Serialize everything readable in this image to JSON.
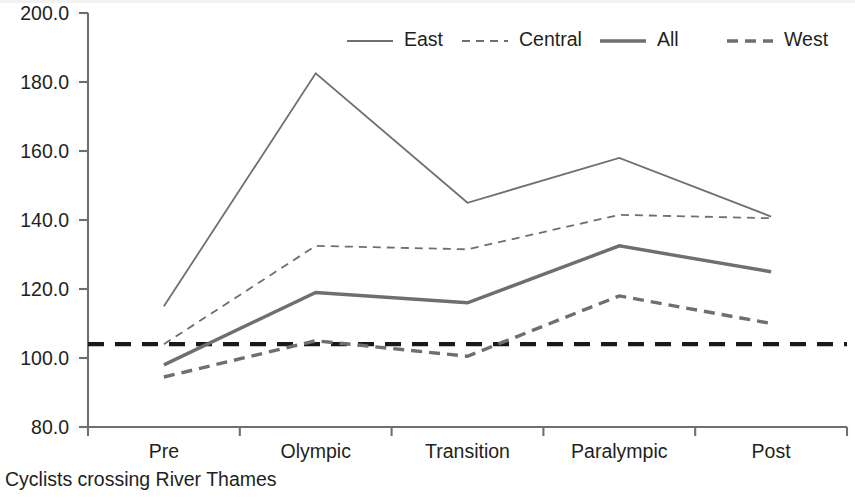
{
  "caption": "Cyclists crossing River Thames",
  "colors": {
    "series_gray": "#6f6f70",
    "reference_black": "#1a1a1a",
    "text": "#231f20",
    "background": "#ffffff"
  },
  "chart_data": {
    "type": "line",
    "title": "",
    "subtitle": "",
    "xlabel": "",
    "ylabel": "",
    "categories": [
      "Pre",
      "Olympic",
      "Transition",
      "Paralympic",
      "Post"
    ],
    "ylim": [
      80.0,
      200.0
    ],
    "ytick_labels": [
      "200.0",
      "180.0",
      "160.0",
      "140.0",
      "120.0",
      "100.0",
      "80.0"
    ],
    "ytick_values": [
      200.0,
      180.0,
      160.0,
      140.0,
      120.0,
      100.0,
      80.0
    ],
    "grid": false,
    "legend_position": "top",
    "series": [
      {
        "name": "East",
        "values": [
          115.0,
          182.5,
          145.0,
          158.0,
          141.0
        ],
        "style": "solid",
        "width": "thin",
        "color": "#6f6f70"
      },
      {
        "name": "Central",
        "values": [
          104.0,
          132.5,
          131.5,
          141.5,
          140.5
        ],
        "style": "dashed",
        "width": "thin",
        "color": "#6f6f70"
      },
      {
        "name": "All",
        "values": [
          98.0,
          119.0,
          116.0,
          132.5,
          125.0
        ],
        "style": "solid",
        "width": "thick",
        "color": "#6f6f70"
      },
      {
        "name": "West",
        "values": [
          94.5,
          105.0,
          100.5,
          118.0,
          110.0
        ],
        "style": "dashed",
        "width": "thick",
        "color": "#6f6f70"
      }
    ],
    "reference_line": {
      "name": "baseline",
      "value": 104.0,
      "style": "dashed",
      "color": "#1a1a1a"
    }
  },
  "legend": {
    "items": [
      {
        "label": "East"
      },
      {
        "label": "Central"
      },
      {
        "label": "All"
      },
      {
        "label": "West"
      }
    ]
  }
}
